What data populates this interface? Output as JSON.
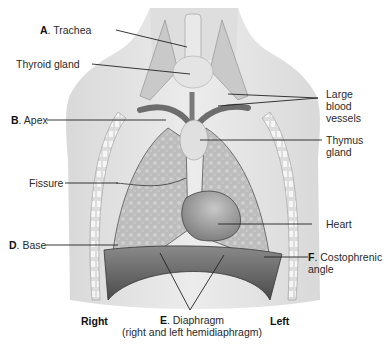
{
  "figure": {
    "side_labels": {
      "right": "Right",
      "left": "Left"
    },
    "labels": {
      "trachea": {
        "letter": "A",
        "sep": ". ",
        "text": "Trachea"
      },
      "thyroid": {
        "letter": "",
        "sep": "",
        "text": "Thyroid gland"
      },
      "apex": {
        "letter": "B",
        "sep": ". ",
        "text": "Apex"
      },
      "fissure": {
        "letter": "",
        "sep": "",
        "text": "Fissure"
      },
      "base": {
        "letter": "D",
        "sep": ". ",
        "text": "Base"
      },
      "vessels": {
        "line1": "Large",
        "line2": "blood",
        "line3": "vessels"
      },
      "thymus": {
        "line1": "Thymus",
        "line2": "gland"
      },
      "heart": {
        "text": "Heart"
      },
      "costophrenic": {
        "letter": "F",
        "sep": ". ",
        "line1": "Costophrenic",
        "line2": "angle"
      },
      "diaphragm": {
        "letter": "E",
        "sep": ". ",
        "line1": "Diaphragm",
        "line2": "(right and left hemidiaphragm)"
      }
    },
    "colors": {
      "skin": "#e6e6e6",
      "lung": "#b9b9b9",
      "heart": "#8e8e8e",
      "diaphragm": "#5e5e5e",
      "rib": "#f4f4f4",
      "line": "#222222"
    }
  }
}
